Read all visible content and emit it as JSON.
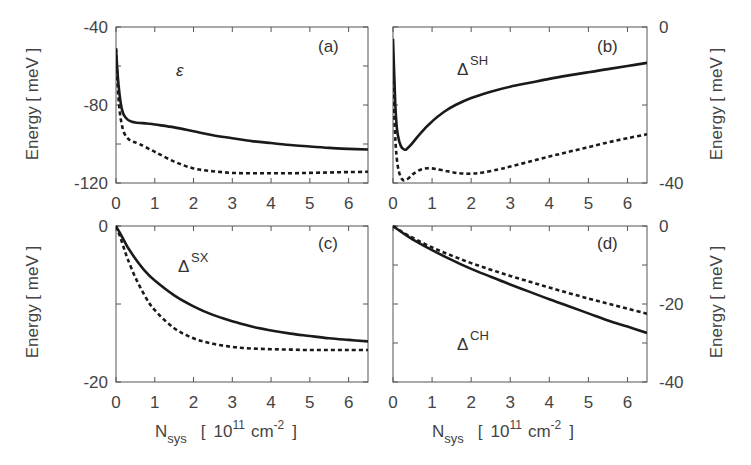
{
  "chart_data": [
    {
      "type": "line",
      "panel": "(a)",
      "quantity": "ε",
      "quantity_sup": "",
      "ylabel": "Energy [ meV ]",
      "ylabel_side": "left",
      "xlim": [
        0,
        6.5
      ],
      "ylim": [
        -120,
        -40
      ],
      "yticks_labeled": [
        -40,
        -80,
        -120
      ],
      "yticks_minor": [
        -60,
        -100
      ],
      "xticks": [
        0,
        1,
        2,
        3,
        4,
        5,
        6
      ],
      "x_ticklabels_shown": true,
      "series": [
        {
          "name": "solid",
          "style": "solid",
          "x": [
            0,
            0.05,
            0.1,
            0.15,
            0.2,
            0.3,
            0.4,
            0.5,
            0.8,
            1.0,
            1.5,
            2,
            2.5,
            3,
            3.5,
            4,
            4.5,
            5,
            5.5,
            6,
            6.5
          ],
          "y": [
            -51,
            -66,
            -76,
            -82,
            -85,
            -87.5,
            -88.5,
            -89,
            -89.5,
            -90,
            -91.5,
            -93.5,
            -95.5,
            -97,
            -98.5,
            -99.5,
            -100.5,
            -101.3,
            -102,
            -102.5,
            -102.8
          ]
        },
        {
          "name": "dashed",
          "style": "dashed",
          "x": [
            0,
            0.05,
            0.1,
            0.15,
            0.2,
            0.3,
            0.4,
            0.6,
            1.0,
            1.5,
            2,
            2.5,
            3,
            3.5,
            4,
            4.5,
            5,
            5.5,
            6,
            6.5
          ],
          "y": [
            -51,
            -72,
            -84,
            -90,
            -94,
            -97,
            -98.5,
            -100,
            -104,
            -109,
            -112.5,
            -114,
            -114.8,
            -115,
            -115,
            -115,
            -114.8,
            -114.6,
            -114.4,
            -114.2
          ]
        }
      ]
    },
    {
      "type": "line",
      "panel": "(b)",
      "quantity": "Δ",
      "quantity_sup": "SH",
      "ylabel": "Energy [ meV ]",
      "ylabel_side": "right",
      "xlim": [
        0,
        6.5
      ],
      "ylim": [
        -40,
        0
      ],
      "yticks_labeled": [
        0,
        -40
      ],
      "yticks_minor": [
        -20
      ],
      "xticks": [
        0,
        1,
        2,
        3,
        4,
        5,
        6
      ],
      "x_ticklabels_shown": true,
      "series": [
        {
          "name": "solid",
          "style": "solid",
          "x": [
            0,
            0.03,
            0.06,
            0.1,
            0.15,
            0.2,
            0.25,
            0.3,
            0.35,
            0.45,
            0.6,
            0.8,
            1.0,
            1.3,
            1.6,
            2,
            2.5,
            3,
            3.5,
            4,
            4.5,
            5,
            5.5,
            6,
            6.5
          ],
          "y": [
            -3,
            -12,
            -20,
            -26,
            -29,
            -30.5,
            -31.2,
            -31.5,
            -31.3,
            -30.3,
            -28.5,
            -26.2,
            -24.2,
            -21.8,
            -20,
            -18.2,
            -16.6,
            -15.3,
            -14.3,
            -13.3,
            -12.4,
            -11.6,
            -10.8,
            -10,
            -9.2
          ]
        },
        {
          "name": "dashed",
          "style": "dashed",
          "x": [
            0,
            0.05,
            0.1,
            0.15,
            0.2,
            0.25,
            0.3,
            0.4,
            0.5,
            0.7,
            0.9,
            1.1,
            1.4,
            1.7,
            2.0,
            2.3,
            2.7,
            3,
            3.5,
            4,
            4.5,
            5,
            5.5,
            6,
            6.5
          ],
          "y": [
            -12,
            -27,
            -34,
            -37,
            -38.5,
            -39.2,
            -39.3,
            -38.8,
            -37.8,
            -36.6,
            -36.2,
            -36.4,
            -37,
            -37.5,
            -37.6,
            -37.3,
            -36.5,
            -35.8,
            -34.5,
            -33.2,
            -32,
            -30.8,
            -29.6,
            -28.5,
            -27.5
          ]
        }
      ]
    },
    {
      "type": "line",
      "panel": "(c)",
      "quantity": "Δ",
      "quantity_sup": "SX",
      "ylabel": "Energy [ meV ]",
      "ylabel_side": "left",
      "xlabel": "N_sys [ 10^11 cm^-2 ]",
      "xlim": [
        0,
        6.5
      ],
      "ylim": [
        -20,
        0
      ],
      "yticks_labeled": [
        0,
        -20
      ],
      "yticks_minor": [
        -10
      ],
      "xticks": [
        0,
        1,
        2,
        3,
        4,
        5,
        6
      ],
      "x_ticklabels_shown": true,
      "series": [
        {
          "name": "solid",
          "style": "solid",
          "x": [
            0,
            0.1,
            0.2,
            0.3,
            0.5,
            0.75,
            1.0,
            1.5,
            2,
            2.5,
            3,
            3.5,
            4,
            4.5,
            5,
            5.5,
            6,
            6.5
          ],
          "y": [
            0,
            -0.9,
            -1.8,
            -2.7,
            -4.2,
            -5.8,
            -7.0,
            -8.9,
            -10.3,
            -11.4,
            -12.2,
            -12.9,
            -13.4,
            -13.8,
            -14.1,
            -14.4,
            -14.6,
            -14.8
          ]
        },
        {
          "name": "dashed",
          "style": "dashed",
          "x": [
            0,
            0.1,
            0.2,
            0.3,
            0.5,
            0.75,
            1.0,
            1.5,
            2,
            2.5,
            3,
            3.5,
            4,
            4.5,
            5,
            5.5,
            6,
            6.5
          ],
          "y": [
            0,
            -1.3,
            -2.8,
            -4.2,
            -6.6,
            -9.0,
            -10.8,
            -13.1,
            -14.4,
            -15.1,
            -15.5,
            -15.7,
            -15.8,
            -15.85,
            -15.9,
            -15.9,
            -15.9,
            -15.9
          ]
        }
      ]
    },
    {
      "type": "line",
      "panel": "(d)",
      "quantity": "Δ",
      "quantity_sup": "CH",
      "ylabel": "Energy [ meV ]",
      "ylabel_side": "right",
      "xlabel": "N_sys [ 10^11 cm^-2 ]",
      "xlim": [
        0,
        6.5
      ],
      "ylim": [
        -40,
        0
      ],
      "yticks_labeled": [
        0,
        -20,
        -40
      ],
      "yticks_minor": [
        -10,
        -30
      ],
      "xticks": [
        0,
        1,
        2,
        3,
        4,
        5,
        6
      ],
      "x_ticklabels_shown": true,
      "series": [
        {
          "name": "solid",
          "style": "solid",
          "x": [
            0,
            0.25,
            0.5,
            1,
            1.5,
            2,
            2.5,
            3,
            3.5,
            4,
            4.5,
            5,
            5.5,
            6,
            6.5
          ],
          "y": [
            0,
            -1.8,
            -3.4,
            -6.2,
            -8.7,
            -11.0,
            -13.0,
            -15.0,
            -16.9,
            -18.8,
            -20.6,
            -22.4,
            -24.2,
            -25.8,
            -27.4
          ]
        },
        {
          "name": "dashed",
          "style": "dashed",
          "x": [
            0,
            0.25,
            0.5,
            1,
            1.5,
            2,
            2.5,
            3,
            3.5,
            4,
            4.5,
            5,
            5.5,
            6,
            6.5
          ],
          "y": [
            0,
            -1.6,
            -3.0,
            -5.5,
            -7.6,
            -9.5,
            -11.2,
            -12.8,
            -14.3,
            -15.8,
            -17.2,
            -18.6,
            -19.9,
            -21.2,
            -22.5
          ]
        }
      ]
    }
  ],
  "figure": {
    "panels": [
      {
        "label": "(a)",
        "quantity": "ε",
        "sup": ""
      },
      {
        "label": "(b)",
        "quantity": "Δ",
        "sup": "SH"
      },
      {
        "label": "(c)",
        "quantity": "Δ",
        "sup": "SX"
      },
      {
        "label": "(d)",
        "quantity": "Δ",
        "sup": "CH"
      }
    ],
    "ylabel": "Energy [ meV ]",
    "xlabel": {
      "main": "N",
      "sub": "sys",
      "bracket_open": "[",
      "base": "10",
      "exp": "11",
      "unit": "cm",
      "unit_exp": "-2",
      "bracket_close": "]"
    },
    "colors": {
      "line": "#1a1a1a",
      "frame": "#555555",
      "text": "#444444"
    }
  }
}
